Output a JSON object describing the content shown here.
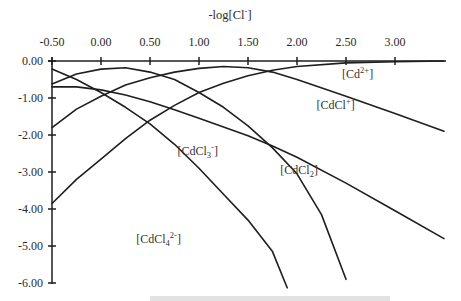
{
  "chart_data": {
    "type": "line",
    "title": "",
    "xlabel": "-log[Cl-]",
    "ylabel": "",
    "x_axis_position": "top",
    "xlim": [
      -0.5,
      3.5
    ],
    "ylim": [
      -6.0,
      0.0
    ],
    "grid": false,
    "legend": "inline labels",
    "x_ticks": [
      "-0.50",
      "0.00",
      "0.50",
      "1.00",
      "1.50",
      "2.00",
      "2.50",
      "3.00"
    ],
    "x_tick_values": [
      -0.5,
      0.0,
      0.5,
      1.0,
      1.5,
      2.0,
      2.5,
      3.0
    ],
    "y_ticks": [
      "0.00",
      "-1.00",
      "-2.00",
      "-3.00",
      "-4.00",
      "-5.00",
      "-6.00"
    ],
    "y_tick_values": [
      0,
      -1,
      -2,
      -3,
      -4,
      -5,
      -6
    ],
    "series": [
      {
        "name": "[Cd2+]",
        "label_main": "[Cd",
        "label_sup": "2+",
        "label_sub": "",
        "label_end": "]",
        "label_pos": [
          2.46,
          -0.45
        ],
        "x": [
          -0.5,
          -0.25,
          0.0,
          0.25,
          0.5,
          0.75,
          1.0,
          1.25,
          1.5,
          1.75,
          2.0,
          2.5,
          3.0,
          3.5
        ],
        "y": [
          -3.85,
          -3.2,
          -2.65,
          -2.1,
          -1.6,
          -1.2,
          -0.85,
          -0.6,
          -0.4,
          -0.25,
          -0.15,
          -0.05,
          -0.02,
          0.0
        ]
      },
      {
        "name": "[CdCl+]",
        "label_main": "[CdCl",
        "label_sup": "+",
        "label_sub": "",
        "label_end": "]",
        "label_pos": [
          2.2,
          -1.3
        ],
        "x": [
          -0.5,
          -0.25,
          0.0,
          0.25,
          0.5,
          0.75,
          1.0,
          1.25,
          1.5,
          1.75,
          2.0,
          2.5,
          3.0,
          3.5
        ],
        "y": [
          -1.8,
          -1.3,
          -0.95,
          -0.65,
          -0.45,
          -0.3,
          -0.2,
          -0.15,
          -0.18,
          -0.3,
          -0.5,
          -0.95,
          -1.42,
          -1.9
        ]
      },
      {
        "name": "[CdCl2]",
        "label_main": "[CdCl",
        "label_sup": "",
        "label_sub": "2",
        "label_end": "]",
        "label_pos": [
          1.83,
          -3.05
        ],
        "x": [
          -0.5,
          -0.25,
          0.0,
          0.25,
          0.5,
          0.75,
          1.0,
          1.25,
          1.5,
          1.75,
          2.0,
          2.5,
          3.0,
          3.5
        ],
        "y": [
          -0.7,
          -0.7,
          -0.78,
          -0.92,
          -1.1,
          -1.32,
          -1.55,
          -1.78,
          -2.02,
          -2.3,
          -2.6,
          -3.3,
          -4.05,
          -4.8
        ]
      },
      {
        "name": "[CdCl3-]",
        "label_main": "[CdCl",
        "label_sup": "-",
        "label_sub": "3",
        "label_end": "]",
        "label_pos": [
          0.78,
          -2.55
        ],
        "x": [
          -0.5,
          -0.25,
          0.0,
          0.25,
          0.5,
          0.75,
          1.0,
          1.25,
          1.5,
          1.75,
          2.0,
          2.25,
          2.5
        ],
        "y": [
          -0.62,
          -0.35,
          -0.22,
          -0.18,
          -0.3,
          -0.5,
          -0.85,
          -1.25,
          -1.75,
          -2.35,
          -3.05,
          -4.15,
          -5.9
        ]
      },
      {
        "name": "[CdCl4 2-]",
        "label_main": "[CdCl",
        "label_sup": "2-",
        "label_sub": "4",
        "label_end": "]",
        "label_pos": [
          0.36,
          -4.92
        ],
        "x": [
          -0.5,
          -0.25,
          0.0,
          0.25,
          0.5,
          0.75,
          1.0,
          1.25,
          1.5,
          1.75,
          1.9
        ],
        "y": [
          -0.22,
          -0.5,
          -0.85,
          -1.25,
          -1.7,
          -2.25,
          -2.9,
          -3.6,
          -4.3,
          -5.15,
          -6.13
        ]
      }
    ]
  },
  "caption_partial": "(caption truncated at bottom edge)"
}
